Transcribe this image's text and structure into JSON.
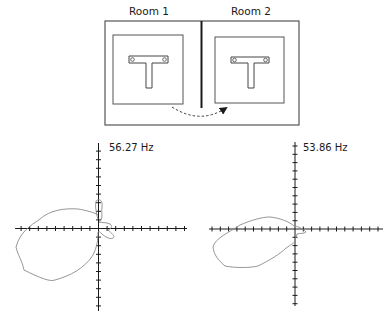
{
  "figure": {
    "rooms": [
      {
        "label": "Room 1",
        "object": "T-shaped fixture with two bolt holes"
      },
      {
        "label": "Room 2",
        "object": "T-shaped fixture with two bolt holes"
      }
    ],
    "arrow": "dashed curved arrow from Room 1 to Room 2"
  },
  "plots": [
    {
      "label": "56.27 Hz",
      "type": "polar directivity pattern"
    },
    {
      "label": "53.86 Hz",
      "type": "polar directivity pattern"
    }
  ],
  "colors": {
    "line": "#1a1a1a",
    "curve": "#8a8a8a",
    "box": "#555555"
  }
}
